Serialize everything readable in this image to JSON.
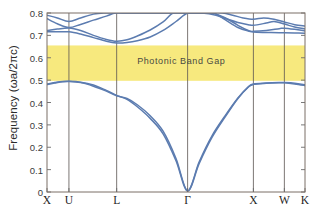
{
  "chart_data": {
    "type": "line",
    "title": "",
    "xlabel": "",
    "ylabel": "Frequency (ωa/2πc)",
    "ylim": [
      0,
      0.8
    ],
    "yticks": [
      "0",
      "0.1",
      "0.2",
      "0.3",
      "0.4",
      "0.5",
      "0.6",
      "0.7",
      "0.8"
    ],
    "ytick_values": [
      0,
      0.1,
      0.2,
      0.3,
      0.4,
      0.5,
      0.6,
      0.7,
      0.8
    ],
    "grid": "vertical-only",
    "legend": "none",
    "xtick_labels": [
      "X",
      "U",
      "L",
      "Γ",
      "X",
      "W",
      "K"
    ],
    "xtick_positions": [
      0.0,
      0.085,
      0.27,
      0.545,
      0.8,
      0.92,
      1.0
    ],
    "annotations": [
      {
        "text": "Photonic Band Gap",
        "x": 0.52,
        "y": 0.585
      }
    ],
    "shaded_region": {
      "label": "Photonic Band Gap",
      "y_min": 0.497,
      "y_max": 0.655,
      "color": "#f7e97e"
    },
    "line_color": "#5c7cb0",
    "series": [
      {
        "name": "band-1",
        "comment": "lowest acoustic-like band, zero at Gamma",
        "points": [
          [
            0.0,
            0.483
          ],
          [
            0.03,
            0.489
          ],
          [
            0.06,
            0.494
          ],
          [
            0.085,
            0.495
          ],
          [
            0.13,
            0.491
          ],
          [
            0.18,
            0.478
          ],
          [
            0.23,
            0.454
          ],
          [
            0.27,
            0.432
          ],
          [
            0.31,
            0.414
          ],
          [
            0.35,
            0.381
          ],
          [
            0.4,
            0.329
          ],
          [
            0.45,
            0.26
          ],
          [
            0.5,
            0.14
          ],
          [
            0.545,
            0.005
          ],
          [
            0.59,
            0.135
          ],
          [
            0.64,
            0.252
          ],
          [
            0.69,
            0.34
          ],
          [
            0.74,
            0.42
          ],
          [
            0.78,
            0.47
          ],
          [
            0.8,
            0.483
          ],
          [
            0.85,
            0.487
          ],
          [
            0.9,
            0.489
          ],
          [
            0.92,
            0.489
          ],
          [
            0.96,
            0.486
          ],
          [
            1.0,
            0.479
          ]
        ]
      },
      {
        "name": "band-2",
        "comment": "second band, degenerate with band-1 at left X then splits",
        "points": [
          [
            0.0,
            0.48
          ],
          [
            0.03,
            0.487
          ],
          [
            0.06,
            0.493
          ],
          [
            0.085,
            0.494
          ],
          [
            0.13,
            0.489
          ],
          [
            0.18,
            0.473
          ],
          [
            0.23,
            0.451
          ],
          [
            0.27,
            0.43
          ],
          [
            0.31,
            0.418
          ],
          [
            0.35,
            0.39
          ],
          [
            0.4,
            0.341
          ],
          [
            0.45,
            0.272
          ],
          [
            0.5,
            0.15
          ],
          [
            0.545,
            0.005
          ],
          [
            0.59,
            0.128
          ],
          [
            0.64,
            0.245
          ],
          [
            0.69,
            0.335
          ],
          [
            0.74,
            0.418
          ],
          [
            0.78,
            0.468
          ],
          [
            0.8,
            0.481
          ],
          [
            0.85,
            0.486
          ],
          [
            0.9,
            0.488
          ],
          [
            0.92,
            0.488
          ],
          [
            0.96,
            0.483
          ],
          [
            1.0,
            0.476
          ]
        ]
      },
      {
        "name": "band-3",
        "comment": "lowest upper band, dips to ~0.665 at L",
        "points": [
          [
            0.0,
            0.716
          ],
          [
            0.04,
            0.716
          ],
          [
            0.085,
            0.716
          ],
          [
            0.13,
            0.706
          ],
          [
            0.18,
            0.69
          ],
          [
            0.23,
            0.674
          ],
          [
            0.27,
            0.666
          ],
          [
            0.31,
            0.668
          ],
          [
            0.35,
            0.676
          ],
          [
            0.4,
            0.693
          ],
          [
            0.45,
            0.722
          ],
          [
            0.5,
            0.762
          ],
          [
            0.545,
            0.8
          ],
          [
            0.59,
            0.8
          ],
          [
            0.64,
            0.8
          ],
          [
            0.69,
            0.779
          ],
          [
            0.74,
            0.745
          ],
          [
            0.78,
            0.722
          ],
          [
            0.8,
            0.715
          ],
          [
            0.85,
            0.713
          ],
          [
            0.9,
            0.712
          ],
          [
            0.92,
            0.712
          ],
          [
            0.96,
            0.711
          ],
          [
            1.0,
            0.709
          ]
        ]
      },
      {
        "name": "band-4",
        "comment": "band crossing near U, rising to 0.8 in L-Gamma",
        "points": [
          [
            0.0,
            0.722
          ],
          [
            0.04,
            0.728
          ],
          [
            0.085,
            0.733
          ],
          [
            0.13,
            0.722
          ],
          [
            0.18,
            0.7
          ],
          [
            0.23,
            0.682
          ],
          [
            0.27,
            0.674
          ],
          [
            0.31,
            0.68
          ],
          [
            0.35,
            0.697
          ],
          [
            0.4,
            0.724
          ],
          [
            0.45,
            0.76
          ],
          [
            0.49,
            0.8
          ],
          [
            0.545,
            0.8
          ],
          [
            0.6,
            0.8
          ],
          [
            0.645,
            0.8
          ],
          [
            0.69,
            0.77
          ],
          [
            0.74,
            0.735
          ],
          [
            0.78,
            0.72
          ],
          [
            0.8,
            0.718
          ],
          [
            0.85,
            0.722
          ],
          [
            0.9,
            0.73
          ],
          [
            0.92,
            0.732
          ],
          [
            0.96,
            0.727
          ],
          [
            1.0,
            0.72
          ]
        ]
      },
      {
        "name": "band-5",
        "comment": "band descending from 0.775 at X through U",
        "points": [
          [
            0.0,
            0.775
          ],
          [
            0.04,
            0.752
          ],
          [
            0.085,
            0.735
          ],
          [
            0.13,
            0.749
          ],
          [
            0.18,
            0.768
          ],
          [
            0.23,
            0.786
          ],
          [
            0.265,
            0.8
          ],
          [
            0.31,
            0.8
          ],
          [
            0.36,
            0.8
          ],
          [
            0.41,
            0.8
          ],
          [
            0.46,
            0.8
          ],
          [
            0.545,
            0.8
          ],
          [
            0.6,
            0.8
          ],
          [
            0.655,
            0.79
          ],
          [
            0.7,
            0.772
          ],
          [
            0.74,
            0.758
          ],
          [
            0.78,
            0.748
          ],
          [
            0.8,
            0.745
          ],
          [
            0.85,
            0.755
          ],
          [
            0.88,
            0.762
          ],
          [
            0.92,
            0.751
          ],
          [
            0.96,
            0.737
          ],
          [
            1.0,
            0.729
          ]
        ]
      },
      {
        "name": "band-6",
        "comment": "top band near 0.79-0.8 across the zone",
        "points": [
          [
            0.0,
            0.79
          ],
          [
            0.04,
            0.778
          ],
          [
            0.085,
            0.762
          ],
          [
            0.13,
            0.778
          ],
          [
            0.18,
            0.795
          ],
          [
            0.22,
            0.8
          ],
          [
            0.3,
            0.8
          ],
          [
            0.4,
            0.8
          ],
          [
            0.5,
            0.8
          ],
          [
            0.545,
            0.8
          ],
          [
            0.62,
            0.8
          ],
          [
            0.68,
            0.8
          ],
          [
            0.72,
            0.79
          ],
          [
            0.76,
            0.778
          ],
          [
            0.8,
            0.772
          ],
          [
            0.84,
            0.778
          ],
          [
            0.88,
            0.772
          ],
          [
            0.92,
            0.76
          ],
          [
            0.96,
            0.748
          ],
          [
            1.0,
            0.742
          ]
        ]
      }
    ]
  },
  "axes": {
    "frame_color": "#7a6e66",
    "gridline_color": "#5a5450",
    "tick_color": "#6a6a6a"
  }
}
